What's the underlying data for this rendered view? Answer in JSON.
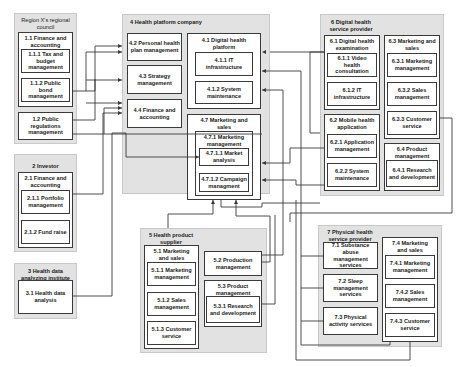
{
  "groups": {
    "g1": {
      "title_num": "1",
      "title": "Region X's regional council",
      "items": {
        "i11": {
          "label": "1.1 Finance and accounting"
        },
        "i111": {
          "label": "1.1.1 Tax and budget management"
        },
        "i112": {
          "label": "1.1.2 Public bond management"
        },
        "i12": {
          "label": "1.2 Public regulations management"
        }
      }
    },
    "g2": {
      "title": "2 Investor",
      "items": {
        "i21": {
          "label": "2.1 Finance and accounting"
        },
        "i211": {
          "label": "2.1.1 Portfolio management"
        },
        "i212": {
          "label": "2.1.2 Fund raise"
        }
      }
    },
    "g3": {
      "title": "3 Health data analyzing institute",
      "items": {
        "i31": {
          "label": "3.1 Health data analysis"
        }
      }
    },
    "g4": {
      "title": "4 Health platform company",
      "items": {
        "i42": {
          "label": "4.2 Personal health plan management"
        },
        "i43": {
          "label": "4.3 Strategy management"
        },
        "i44": {
          "label": "4.4 Finance and accounting"
        },
        "i41": {
          "label": "4.1 Digital health platform"
        },
        "i411": {
          "label": "4.1.1 IT infrastructure"
        },
        "i412": {
          "label": "4.1.2 System maintenance"
        },
        "i47": {
          "label": "4.7 Marketing and sales"
        },
        "i471": {
          "label": "4.7.1 Marketing management"
        },
        "i4711": {
          "label": "4.7.1.1 Market analysis"
        },
        "i4712": {
          "label": "4.7.1.2 Campaign managment"
        }
      }
    },
    "g5": {
      "title": "5 Health product supplier",
      "items": {
        "i51": {
          "label": "5.1 Marketing and sales"
        },
        "i511": {
          "label": "5.1.1 Marketing management"
        },
        "i512": {
          "label": "5.1.2 Sales management"
        },
        "i513": {
          "label": "5.1.3 Customer service"
        },
        "i52": {
          "label": "5.2 Production management"
        },
        "i53": {
          "label": "5.3 Product management"
        },
        "i531": {
          "label": "5.3.1 Research and development"
        }
      }
    },
    "g6": {
      "title": "6 Digital health service provider",
      "items": {
        "i61": {
          "label": "6.1 Digital health examination"
        },
        "i611": {
          "label": "6.1.1 Video health consultation"
        },
        "i612": {
          "label": "6.1.2 IT infrastructure"
        },
        "i62": {
          "label": "6.2 Mobile health application"
        },
        "i621": {
          "label": "6.2.1 Application management"
        },
        "i622": {
          "label": "6.2.2 System maintenance"
        },
        "i63": {
          "label": "6.3 Marketing and sales"
        },
        "i631": {
          "label": "6.3.1 Marketing management"
        },
        "i632": {
          "label": "6.3.2 Sales management"
        },
        "i633": {
          "label": "6.3.3 Customer service"
        },
        "i64": {
          "label": "6.4 Product management"
        },
        "i641": {
          "label": "6.4.1 Research and development"
        }
      }
    },
    "g7": {
      "title": "7 Physical health service provider",
      "items": {
        "i71": {
          "label": "7.1 Substance abuse management services"
        },
        "i72": {
          "label": "7.2 Sleep management services"
        },
        "i73": {
          "label": "7.3 Physical activity services"
        },
        "i74": {
          "label": "7.4 Marketing and sales"
        },
        "i741": {
          "label": "7.4.1 Marketing management"
        },
        "i742": {
          "label": "7.4.2 Sales management"
        },
        "i743": {
          "label": "7.4.3 Customer service"
        }
      }
    }
  },
  "colors": {
    "group_fill": "#e2e2e2",
    "box_fill": "#ffffff",
    "line": "#3a3a3a"
  }
}
